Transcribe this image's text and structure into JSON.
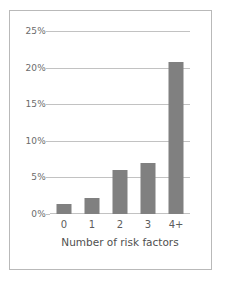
{
  "chart_data": {
    "type": "bar",
    "title": "",
    "xlabel": "Number of risk factors",
    "ylabel": "",
    "categories": [
      "0",
      "1",
      "2",
      "3",
      "4+"
    ],
    "values": [
      1.4,
      2.2,
      6.0,
      7.0,
      20.8
    ],
    "value_labels": [
      "1.4%",
      "2.2%",
      "6.0%",
      "7.0%",
      "20.8%"
    ],
    "ylim": [
      0,
      25
    ],
    "yticks": [
      0,
      5,
      10,
      15,
      20,
      25
    ],
    "ytick_labels": [
      "0%",
      "5%",
      "10%",
      "15%",
      "20%",
      "25%"
    ],
    "grid": true,
    "grid_axis": "y",
    "legend": false,
    "bar_color": "#808080",
    "grid_color": "#c2c2c2",
    "frame_color": "#b9b9b9",
    "background_color": "#ffffff"
  }
}
